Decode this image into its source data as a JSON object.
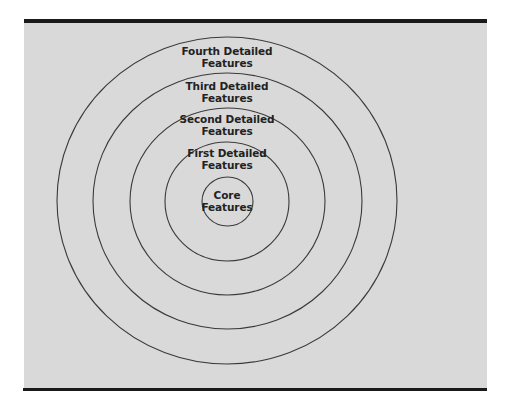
{
  "diagram": {
    "type": "concentric-circles",
    "colors": {
      "background": "#d9d9d9",
      "rule": "#1a1a1a",
      "stroke": "#3a3a3a",
      "text": "#222222"
    },
    "rings": [
      {
        "id": "core",
        "line1": "Core",
        "line2": "Features",
        "cx": 227.5,
        "cy": 201.5,
        "rx": 25.5,
        "ry": 24.5,
        "label_x": 227,
        "label_y": 189
      },
      {
        "id": "first",
        "line1": "First Detailed",
        "line2": "Features",
        "cx": 227,
        "cy": 201.5,
        "rx": 62,
        "ry": 59.5,
        "label_x": 227,
        "label_y": 147
      },
      {
        "id": "second",
        "line1": "Second Detailed",
        "line2": "Features",
        "cx": 227.5,
        "cy": 201.5,
        "rx": 97.5,
        "ry": 93.5,
        "label_x": 227,
        "label_y": 113
      },
      {
        "id": "third",
        "line1": "Third Detailed",
        "line2": "Features",
        "cx": 227.5,
        "cy": 201,
        "rx": 134.5,
        "ry": 128,
        "label_x": 227,
        "label_y": 80
      },
      {
        "id": "fourth",
        "line1": "Fourth Detailed",
        "line2": "Features",
        "cx": 227,
        "cy": 200.5,
        "rx": 170,
        "ry": 163.5,
        "label_x": 227,
        "label_y": 45
      }
    ]
  }
}
